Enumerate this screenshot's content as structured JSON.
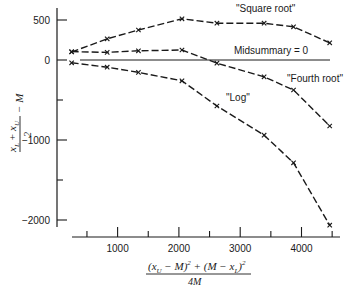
{
  "chart_data": {
    "type": "line",
    "title": "",
    "xlabel": "((x_U − M)^2 + (M − x_L)^2) / 4M",
    "ylabel": "(x_L + x_U)/2 − M",
    "xlim": [
      0,
      4600
    ],
    "ylim": [
      -2100,
      650
    ],
    "x_ticks_major": [
      1000,
      2000,
      3000,
      4000
    ],
    "x_ticks_minor": [
      500,
      1500,
      2500,
      3500,
      4500
    ],
    "x_tick_labels": [
      "1000",
      "2000",
      "3000",
      "4000"
    ],
    "y_ticks_major": [
      500,
      0,
      -1000,
      -2000
    ],
    "y_ticks_minor": [
      -500,
      -1500
    ],
    "y_tick_labels": [
      "500",
      "0",
      "−1000",
      "−2000"
    ],
    "grid": false,
    "legend": "none (series labeled inline)",
    "reference_line": {
      "y": 0,
      "label": "Midsummary = 0"
    },
    "x": [
      250,
      830,
      1340,
      2050,
      2620,
      3390,
      3870,
      4460
    ],
    "series": [
      {
        "name": "\"Square root\"",
        "values": [
          100,
          265,
          375,
          515,
          460,
          460,
          415,
          215
        ]
      },
      {
        "name": "\"Fourth root\"",
        "values": [
          105,
          95,
          115,
          125,
          -40,
          -210,
          -375,
          -825
        ]
      },
      {
        "name": "\"Log\"",
        "values": [
          -35,
          -90,
          -155,
          -260,
          -575,
          -940,
          -1285,
          -2065
        ]
      }
    ],
    "marker": "x",
    "line_style": "dashed"
  },
  "labels": {
    "square_root": "\"Square root\"",
    "fourth_root": "\"Fourth root\"",
    "log": "\"Log\"",
    "midsummary": "Midsummary = 0"
  },
  "axes": {
    "y_ticks": [
      "500",
      "0",
      "−1000",
      "−2000"
    ],
    "x_ticks": [
      "1000",
      "2000",
      "3000",
      "4000"
    ],
    "ylabel_num": "x",
    "ylabel_sub_L": "L",
    "ylabel_plus": "+",
    "ylabel_sub_U": "U",
    "ylabel_den": "2",
    "ylabel_tail": "− M",
    "xlabel_numerator": "(x",
    "xlabel_num_sub_U": "U",
    "xlabel_num_mid": " − M)",
    "xlabel_num_sq1": "2",
    "xlabel_num_plus": " + (M − x",
    "xlabel_num_sub_L": "L",
    "xlabel_num_close": ")",
    "xlabel_num_sq2": "2",
    "xlabel_denominator": "4M"
  }
}
